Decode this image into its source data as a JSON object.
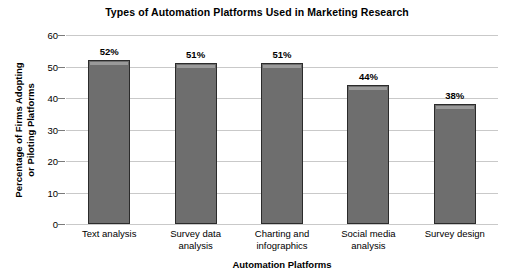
{
  "chart_data": {
    "type": "bar",
    "title": "Types of Automation Platforms Used in Marketing Research",
    "xlabel": "Automation Platforms",
    "ylabel": "Percentage of Firms Adopting or Piloting Platforms",
    "ylabel_line1": "Percentage of Firms Adopting",
    "ylabel_line2": "or Piloting Platforms",
    "categories": [
      "Text analysis",
      "Survey data analysis",
      "Charting and infographics",
      "Social media analysis",
      "Survey design"
    ],
    "category_lines": [
      [
        "Text analysis"
      ],
      [
        "Survey data",
        "analysis"
      ],
      [
        "Charting and",
        "infographics"
      ],
      [
        "Social media",
        "analysis"
      ],
      [
        "Survey design"
      ]
    ],
    "values": [
      52,
      51,
      51,
      44,
      38
    ],
    "data_labels": [
      "52%",
      "51%",
      "51%",
      "44%",
      "38%"
    ],
    "ylim": [
      0,
      60
    ],
    "ytick_values": [
      0,
      10,
      20,
      30,
      40,
      50,
      60
    ],
    "ytick_labels": [
      "0",
      "10",
      "20",
      "30",
      "40",
      "50",
      "60"
    ],
    "grid": true,
    "legend": "none",
    "colors": {
      "bar_fill": "#6e6e6e",
      "bar_border": "#2b2b2b",
      "bar_highlight": "#9a9a9a",
      "gridline": "#c9c9c9",
      "tick": "#7a7a7a",
      "text": "#000000",
      "background": "#ffffff"
    }
  }
}
